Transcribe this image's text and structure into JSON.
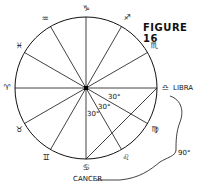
{
  "title": "FIGURE 16",
  "signs": [
    {
      "name": "capricorn",
      "glyph": "♑",
      "x": 86,
      "y": 9
    },
    {
      "name": "sagittarius",
      "glyph": "♐",
      "x": 127,
      "y": 18
    },
    {
      "name": "scorpio",
      "glyph": "♏",
      "x": 154,
      "y": 46
    },
    {
      "name": "libra",
      "glyph": "♎",
      "x": 165,
      "y": 88
    },
    {
      "name": "virgo",
      "glyph": "♍",
      "x": 155,
      "y": 130
    },
    {
      "name": "leo",
      "glyph": "♌",
      "x": 126,
      "y": 158
    },
    {
      "name": "cancer",
      "glyph": "♋",
      "x": 86,
      "y": 166
    },
    {
      "name": "gemini",
      "glyph": "♊",
      "x": 46,
      "y": 158
    },
    {
      "name": "taurus",
      "glyph": "♉",
      "x": 19,
      "y": 130
    },
    {
      "name": "aries",
      "glyph": "♈",
      "x": 7,
      "y": 88
    },
    {
      "name": "pisces",
      "glyph": "♓",
      "x": 19,
      "y": 46
    },
    {
      "name": "aquarius",
      "glyph": "♒",
      "x": 45,
      "y": 19
    }
  ],
  "labels": {
    "libra": "LIBRA",
    "cancer": "CANCER",
    "angle_90": "90°",
    "angle_30a": "30°",
    "angle_30b": "30°",
    "angle_30c": "30°"
  }
}
